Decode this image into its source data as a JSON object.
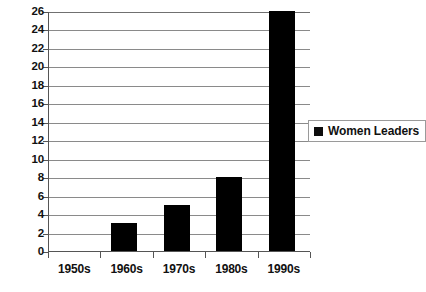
{
  "chart_data": {
    "type": "bar",
    "title": "",
    "subtitle": "",
    "xlabel": "",
    "ylabel": "",
    "categories": [
      "1950s",
      "1960s",
      "1970s",
      "1980s",
      "1990s"
    ],
    "series": [
      {
        "name": "Women Leaders",
        "color": "#000000",
        "values": [
          0,
          3,
          5,
          8,
          26
        ]
      }
    ],
    "ylim": [
      0,
      26
    ],
    "ytick_step": 2,
    "yticks": [
      0,
      2,
      4,
      6,
      8,
      10,
      12,
      14,
      16,
      18,
      20,
      22,
      24,
      26
    ],
    "ytick_labels": [
      "0",
      "2",
      "4",
      "6",
      "8",
      "10",
      "12",
      "14",
      "16",
      "18",
      "20",
      "22",
      "24",
      "26"
    ],
    "grid": true,
    "grid_axis": "y",
    "grid_color": "#8a8a8a",
    "axis_color": "#555555",
    "background": "#ffffff",
    "legend": {
      "position": "right",
      "entries": [
        {
          "label": "Women Leaders",
          "marker": "square",
          "color": "#000000"
        }
      ]
    }
  }
}
